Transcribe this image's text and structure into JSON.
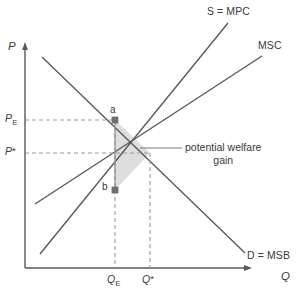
{
  "figure": {
    "kind": "economics-supply-demand-externality-diagram",
    "background_color": "#ffffff",
    "line_color": "#57585a",
    "dash_color": "#9a9a9a",
    "shade_color": "#dededd",
    "text_color": "#3b3b3b"
  },
  "axes": {
    "y_label": "P",
    "x_label": "Q",
    "origin": {
      "x": 25,
      "y": 268
    },
    "y_top": {
      "x": 25,
      "y": 45
    },
    "x_right": {
      "x": 252,
      "y": 268
    }
  },
  "curves": [
    {
      "id": "supply-mpc",
      "label": "S = MPC",
      "label_x": 207,
      "label_y": 11,
      "from": {
        "x": 40,
        "y": 254
      },
      "to": {
        "x": 228,
        "y": 23
      }
    },
    {
      "id": "msc",
      "label": "MSC",
      "label_x": 258,
      "label_y": 45,
      "from": {
        "x": 35,
        "y": 204
      },
      "to": {
        "x": 262,
        "y": 56
      }
    },
    {
      "id": "demand-msb",
      "label": "D = MSB",
      "label_x": 247,
      "label_y": 255,
      "from": {
        "x": 42,
        "y": 57
      },
      "to": {
        "x": 245,
        "y": 253
      }
    }
  ],
  "price_levels": [
    {
      "id": "pe",
      "label": "P",
      "subscript": "E",
      "label_x": 5,
      "label_y": 113,
      "y": 120,
      "dash_from_x": 25,
      "dash_to_x": 115
    },
    {
      "id": "p-star",
      "label": "P",
      "star": "*",
      "label_x": 5,
      "label_y": 146,
      "y": 153,
      "dash_from_x": 25,
      "dash_to_x": 150
    }
  ],
  "quantity_levels": [
    {
      "id": "qe",
      "label": "Q",
      "subscript": "E",
      "label_x": 107,
      "label_y": 275,
      "x": 115,
      "dash_from_y": 120,
      "dash_to_y": 268
    },
    {
      "id": "q-star",
      "label": "Q",
      "star": "*",
      "label_x": 142,
      "label_y": 275,
      "x": 150,
      "dash_from_y": 153,
      "dash_to_y": 268
    }
  ],
  "points": [
    {
      "id": "point-a",
      "label": "a",
      "x": 115,
      "y": 120,
      "label_x": 110,
      "label_y": 105
    },
    {
      "id": "point-b",
      "label": "b",
      "x": 115,
      "y": 190,
      "label_x": 102,
      "label_y": 182
    }
  ],
  "welfare_triangle": {
    "id": "potential-welfare-gain-area",
    "vertices": [
      {
        "x": 115,
        "y": 120
      },
      {
        "x": 150,
        "y": 153
      },
      {
        "x": 115,
        "y": 190
      }
    ]
  },
  "annotation": {
    "id": "potential-welfare-gain",
    "line1": "potential welfare",
    "line2": "gain",
    "text_x": 185,
    "text_y": 144,
    "leader_from": {
      "x": 140,
      "y": 148
    },
    "leader_to": {
      "x": 182,
      "y": 148
    }
  }
}
